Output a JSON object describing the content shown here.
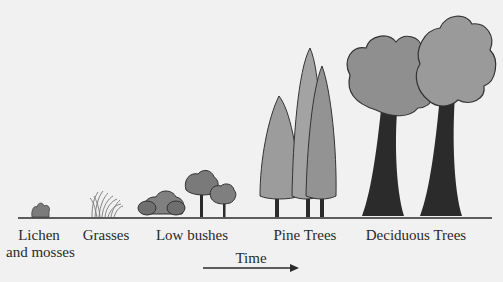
{
  "diagram": {
    "type": "ecological-succession",
    "stages": [
      {
        "id": "lichen",
        "label_line1": "Lichen",
        "label_line2": "and mosses"
      },
      {
        "id": "grasses",
        "label_line1": "Grasses"
      },
      {
        "id": "low-bushes",
        "label_line1": "Low bushes"
      },
      {
        "id": "pine-trees",
        "label_line1": "Pine Trees"
      },
      {
        "id": "deciduous-trees",
        "label_line1": "Deciduous Trees"
      }
    ],
    "axis": {
      "label": "Time",
      "direction": "left-to-right"
    },
    "colors": {
      "background": "#f1f1f1",
      "ground": "#2a2a2a",
      "foliage_light": "#9a9a9a",
      "foliage_dark": "#6e6e6e",
      "trunk": "#2b2b2b"
    }
  }
}
